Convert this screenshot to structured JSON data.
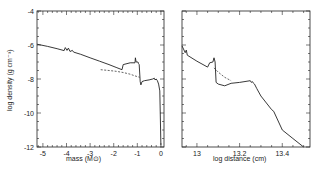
{
  "chart_data": [
    {
      "type": "line",
      "panel": "left",
      "title": "",
      "xlabel": "mass (M⊙)",
      "ylabel": "log density (g cm⁻³)",
      "xlim": [
        -5.25,
        0.13
      ],
      "ylim": [
        -12,
        -4
      ],
      "xticks": [
        -5,
        -4,
        -3,
        -2,
        -1,
        0
      ],
      "xtick_labels": [
        "-5",
        "-4",
        "-3",
        "-2",
        "-1",
        "0"
      ],
      "yticks": [
        -4,
        -6,
        -8,
        -10,
        -12
      ],
      "ytick_labels": [
        "-4",
        "-6",
        "-8",
        "-10",
        "-12"
      ],
      "grid": false,
      "legend": null,
      "series": [
        {
          "name": "solid",
          "style": "solid",
          "x": [
            -5.25,
            -4.8,
            -4.4,
            -4.1,
            -4.05,
            -3.98,
            -3.92,
            -3.85,
            -3.75,
            -3.7,
            -3.4,
            -3.0,
            -2.6,
            -2.2,
            -1.9,
            -1.65,
            -1.6,
            -1.3,
            -1.1,
            -1.08,
            -1.05,
            -1.0,
            -0.97,
            -0.95,
            -0.92,
            -0.88,
            -0.85,
            -0.8,
            -0.7,
            -0.5,
            -0.35,
            -0.28,
            -0.25,
            -0.2,
            -0.15,
            -0.1,
            -0.05,
            0.0
          ],
          "y": [
            -5.95,
            -6.08,
            -6.22,
            -6.33,
            -6.15,
            -6.32,
            -6.18,
            -6.38,
            -6.32,
            -6.42,
            -6.55,
            -6.75,
            -6.95,
            -7.15,
            -7.32,
            -7.45,
            -7.15,
            -7.05,
            -7.05,
            -6.75,
            -7.0,
            -7.0,
            -7.0,
            -7.1,
            -7.15,
            -8.15,
            -8.35,
            -8.15,
            -8.1,
            -8.05,
            -8.0,
            -7.95,
            -8.05,
            -8.0,
            -8.1,
            -8.3,
            -8.7,
            -11.9
          ]
        },
        {
          "name": "dashed",
          "style": "dashed",
          "x": [
            -2.55,
            -2.2,
            -1.9,
            -1.6,
            -1.3,
            -1.1,
            -0.9
          ],
          "y": [
            -7.45,
            -7.5,
            -7.55,
            -7.62,
            -7.72,
            -7.82,
            -7.9
          ]
        }
      ]
    },
    {
      "type": "line",
      "panel": "right",
      "title": "",
      "xlabel": "log distance (cm)",
      "ylabel": "",
      "xlim": [
        12.93,
        13.53
      ],
      "ylim": [
        -12,
        -4
      ],
      "xticks": [
        13,
        13.2,
        13.4
      ],
      "xtick_labels": [
        "13",
        "13.2",
        "13.4"
      ],
      "yticks": [
        -4,
        -6,
        -8,
        -10,
        -12
      ],
      "ytick_labels": [],
      "grid": false,
      "legend": null,
      "series": [
        {
          "name": "solid",
          "style": "solid",
          "x": [
            12.93,
            12.945,
            12.95,
            12.955,
            13.0,
            13.05,
            13.06,
            13.075,
            13.08,
            13.085,
            13.09,
            13.1,
            13.13,
            13.16,
            13.2,
            13.25,
            13.255,
            13.26,
            13.265,
            13.27,
            13.28,
            13.3,
            13.35,
            13.36,
            13.4,
            13.45,
            13.5
          ],
          "y": [
            -6.05,
            -6.45,
            -6.3,
            -6.6,
            -6.95,
            -7.3,
            -7.05,
            -7.0,
            -6.75,
            -7.0,
            -8.2,
            -8.3,
            -8.4,
            -8.25,
            -8.2,
            -8.1,
            -8.2,
            -8.15,
            -8.25,
            -8.3,
            -8.55,
            -9.0,
            -9.8,
            -9.9,
            -11.0,
            -11.5,
            -12.0
          ]
        },
        {
          "name": "dashed",
          "style": "dashed",
          "x": [
            13.08,
            13.1,
            13.13,
            13.16
          ],
          "y": [
            -7.35,
            -7.6,
            -7.9,
            -8.1
          ]
        }
      ]
    }
  ],
  "panels": {
    "left": {
      "xlabel": "mass (M⊙)",
      "ylabel": "log density (g cm⁻³)"
    },
    "right": {
      "xlabel": "log distance (cm)"
    }
  },
  "colors": {
    "line": "#222222",
    "axes": "#222222",
    "background": "#ffffff"
  }
}
